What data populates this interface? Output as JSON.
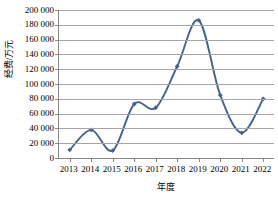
{
  "chart_data": {
    "type": "line",
    "title": "",
    "xlabel": "年度",
    "ylabel": "经费/万元",
    "categories": [
      "2013",
      "2014",
      "2015",
      "2016",
      "2017",
      "2018",
      "2019",
      "2020",
      "2021",
      "2022"
    ],
    "series": [
      {
        "name": "经费",
        "values": [
          11000,
          38000,
          10000,
          73000,
          68000,
          124000,
          186000,
          85000,
          34000,
          80000
        ],
        "color": "#44628F",
        "marker": "diamond",
        "smooth": true
      }
    ],
    "ylim": [
      0,
      200000
    ],
    "ytick_values": [
      0,
      20000,
      40000,
      60000,
      80000,
      100000,
      120000,
      140000,
      160000,
      180000,
      200000
    ],
    "ytick_labels": [
      "0",
      "20 000",
      "40 000",
      "60 000",
      "80 000",
      "100 000",
      "120 000",
      "140 000",
      "160 000",
      "180 000",
      "200 000"
    ],
    "grid": {
      "horizontal": true,
      "vertical": false,
      "color": "#a6a6a6"
    },
    "legend": {
      "visible": false,
      "position": "none"
    },
    "axis_color": "#868686",
    "background": "#ffffff"
  }
}
